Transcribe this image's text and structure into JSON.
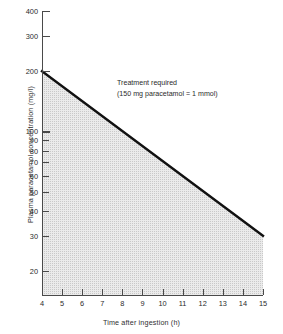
{
  "chart_data": {
    "type": "line",
    "title": "",
    "xlabel": "Time after ingestion (h)",
    "ylabel": "Plasma paracetamol concentration (mg/l)",
    "yscale": "log",
    "ylim": [
      15,
      400
    ],
    "xlim": [
      4,
      15
    ],
    "grid": false,
    "legend": null,
    "y_ticks": [
      400,
      300,
      200,
      100,
      90,
      80,
      70,
      60,
      50,
      40,
      30,
      20
    ],
    "y_tick_labels": [
      "400",
      "300",
      "200",
      "100",
      "90",
      "80",
      "70",
      "60",
      "50",
      "40",
      "30",
      "20"
    ],
    "x_ticks": [
      4,
      5,
      6,
      7,
      8,
      9,
      10,
      11,
      12,
      13,
      14,
      15
    ],
    "x_tick_labels": [
      "4",
      "5",
      "6",
      "7",
      "8",
      "9",
      "10",
      "11",
      "12",
      "13",
      "14",
      "15"
    ],
    "series": [
      {
        "name": "Treatment line",
        "x": [
          4,
          15
        ],
        "values": [
          200,
          30
        ],
        "color": "#111111"
      }
    ],
    "shaded_region": {
      "label": "Treatment required",
      "fill_color": "#ebebeb",
      "description": "Area below the treatment line"
    },
    "annotations": [
      {
        "line1": "Treatment required",
        "line2": "(150 mg paracetamol = 1 mmol)"
      }
    ]
  },
  "annotation": {
    "line1": "Treatment required",
    "line2": "(150 mg paracetamol = 1 mmol)"
  },
  "axes": {
    "x_title": "Time after ingestion (h)",
    "y_title": "Plasma paracetamol concentration (mg/l)"
  }
}
